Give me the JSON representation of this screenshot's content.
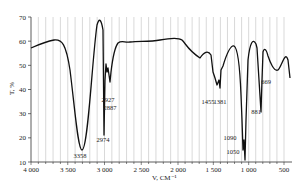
{
  "chart_data": {
    "type": "line",
    "title": "",
    "xlabel": "V, CM⁻¹",
    "ylabel": "T, %",
    "xlim": [
      4000,
      500
    ],
    "ylim": [
      10,
      70
    ],
    "grid": {
      "vertical": true,
      "horizontal": false
    },
    "x_ticks": [
      "4 000",
      "3 500",
      "3 000",
      "2 500",
      "2 000",
      "1 500",
      "1 000",
      "500"
    ],
    "y_ticks": [
      "10",
      "20",
      "30",
      "40",
      "50",
      "60",
      "70"
    ],
    "peak_annotations": [
      {
        "label": "3358",
        "x": 3358,
        "y": 15
      },
      {
        "label": "2974",
        "x": 2974,
        "y": 22
      },
      {
        "label": "2927",
        "x": 2927,
        "y": 41
      },
      {
        "label": "2887",
        "x": 2887,
        "y": 39
      },
      {
        "label": "1455",
        "x": 1455,
        "y": 43
      },
      {
        "label": "1381",
        "x": 1381,
        "y": 40
      },
      {
        "label": "1090",
        "x": 1090,
        "y": 20
      },
      {
        "label": "1050",
        "x": 1050,
        "y": 10
      },
      {
        "label": "881",
        "x": 881,
        "y": 33
      },
      {
        "label": "669",
        "x": 669,
        "y": 48
      }
    ],
    "series": [
      {
        "name": "T, %",
        "x": [
          4000,
          3800,
          3650,
          3500,
          3358,
          3200,
          3050,
          2974,
          2950,
          2927,
          2887,
          2850,
          2800,
          2500,
          2000,
          1800,
          1650,
          1500,
          1455,
          1381,
          1300,
          1150,
          1090,
          1050,
          1000,
          950,
          900,
          881,
          850,
          750,
          669,
          560,
          500
        ],
        "y": [
          63,
          65,
          66,
          45,
          15,
          35,
          69,
          22,
          50,
          46,
          40,
          55,
          60,
          59,
          61,
          52,
          55,
          47,
          43,
          40,
          57,
          40,
          20,
          10,
          60,
          62,
          56,
          33,
          55,
          52,
          48,
          55,
          46
        ]
      }
    ]
  }
}
